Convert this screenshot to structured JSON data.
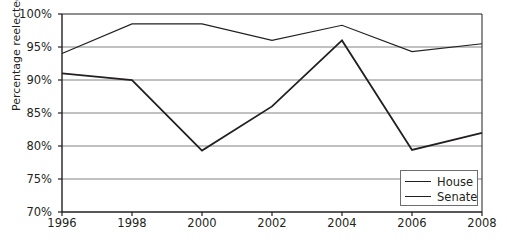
{
  "chart_data": {
    "type": "line",
    "title": "",
    "xlabel": "",
    "ylabel": "Percentage reelected",
    "x": [
      1996,
      1998,
      2000,
      2002,
      2004,
      2006,
      2008
    ],
    "xtick_labels": [
      "1996",
      "1998",
      "2000",
      "2002",
      "2004",
      "2006",
      "2008"
    ],
    "xlim": [
      1996,
      2008
    ],
    "ylim": [
      70,
      100
    ],
    "ytick_values": [
      70,
      75,
      80,
      85,
      90,
      95,
      100
    ],
    "ytick_labels": [
      "70%",
      "75%",
      "80%",
      "85%",
      "90%",
      "95%",
      "100%"
    ],
    "grid": true,
    "grid_axis": "y",
    "legend_position": "bottom-right",
    "series": [
      {
        "name": "House",
        "values": [
          91.0,
          90.0,
          79.3,
          86.0,
          96.0,
          79.4,
          82.0
        ],
        "color": "#231f20",
        "line_width": 1.8
      },
      {
        "name": "Senate",
        "values": [
          94.0,
          98.5,
          98.5,
          96.0,
          98.3,
          94.3,
          95.5
        ],
        "color": "#231f20",
        "line_width": 1.1
      }
    ]
  },
  "legend": {
    "entries": [
      {
        "label": "House"
      },
      {
        "label": "Senate"
      }
    ]
  },
  "colors": {
    "axis": "#231f20",
    "grid": "#808285",
    "line": "#231f20",
    "background": "#ffffff",
    "legend_border": "#6d6e71"
  }
}
